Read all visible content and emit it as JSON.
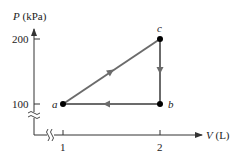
{
  "diagram": {
    "type": "pv-diagram",
    "y_axis": {
      "symbol": "P",
      "unit": "(kPa)",
      "ticks": [
        "200",
        "100"
      ]
    },
    "x_axis": {
      "symbol": "V",
      "unit": "(L)",
      "ticks": [
        "1",
        "2"
      ]
    },
    "points": [
      {
        "label": "a",
        "V": 1,
        "P": 100
      },
      {
        "label": "b",
        "V": 2,
        "P": 100
      },
      {
        "label": "c",
        "V": 2,
        "P": 200
      }
    ],
    "path": [
      "a",
      "c",
      "b",
      "a"
    ],
    "colors": {
      "path": "#6b6b6b",
      "axis": "#333333",
      "points": "#000000"
    }
  }
}
